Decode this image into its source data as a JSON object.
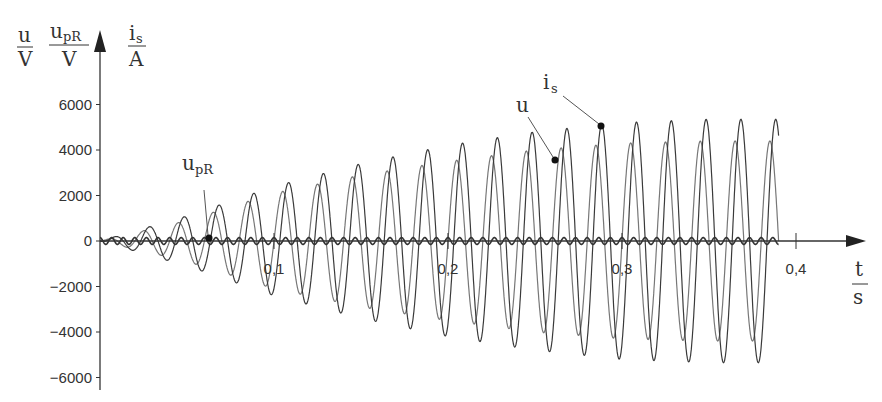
{
  "chart_data": {
    "type": "line",
    "title": "",
    "xlabel": "t / s",
    "ylabel": "u / V, u_pR / V, i_s / A",
    "xlim": [
      0,
      0.44
    ],
    "ylim": [
      -6500,
      7500
    ],
    "x_ticks": [
      0.1,
      0.2,
      0.3,
      0.4
    ],
    "x_tick_labels": [
      "0,1",
      "0,2",
      "0,3",
      "0,4"
    ],
    "y_ticks": [
      6000,
      4000,
      2000,
      0,
      -2000,
      -4000,
      -6000
    ],
    "y_tick_labels": [
      "6000",
      "4000",
      "2000",
      "0",
      "−2000",
      "−4000",
      "−6000"
    ],
    "grid": false,
    "legend": "inline annotations with leader lines",
    "frequency_hz": 50,
    "t_end": 0.39,
    "series": [
      {
        "name": "u",
        "label": "u",
        "description": "voltage, sinusoid with growing amplitude",
        "envelope": [
          {
            "t": 0.0,
            "amp": 0
          },
          {
            "t": 0.05,
            "amp": 900
          },
          {
            "t": 0.1,
            "amp": 2100
          },
          {
            "t": 0.15,
            "amp": 2900
          },
          {
            "t": 0.2,
            "amp": 3500
          },
          {
            "t": 0.25,
            "amp": 4000
          },
          {
            "t": 0.3,
            "amp": 4300
          },
          {
            "t": 0.35,
            "amp": 4400
          },
          {
            "t": 0.39,
            "amp": 4400
          }
        ],
        "phase_deg": 0,
        "color": "#777777"
      },
      {
        "name": "i_s",
        "label": "i_s",
        "description": "current, sinusoid with growing amplitude",
        "envelope": [
          {
            "t": 0.0,
            "amp": 0
          },
          {
            "t": 0.05,
            "amp": 1100
          },
          {
            "t": 0.1,
            "amp": 2400
          },
          {
            "t": 0.15,
            "amp": 3400
          },
          {
            "t": 0.2,
            "amp": 4200
          },
          {
            "t": 0.25,
            "amp": 4800
          },
          {
            "t": 0.3,
            "amp": 5200
          },
          {
            "t": 0.35,
            "amp": 5350
          },
          {
            "t": 0.39,
            "amp": 5350
          }
        ],
        "phase_deg": -60,
        "color": "#3a3a3a"
      },
      {
        "name": "u_pR",
        "label": "u_pR",
        "description": "small ripple around zero",
        "envelope": [
          {
            "t": 0.0,
            "amp": 150
          },
          {
            "t": 0.39,
            "amp": 150
          }
        ],
        "phase_deg": 90,
        "color": "#333333"
      }
    ],
    "annotations": [
      {
        "text": "u",
        "marker_t": 0.267,
        "marker_y": 3600
      },
      {
        "text": "i_s",
        "marker_t": 0.293,
        "marker_y": 5100
      },
      {
        "text": "u_pR",
        "marker_t": 0.063,
        "marker_y": 100
      }
    ]
  },
  "axis": {
    "y_units": [
      {
        "num": "u",
        "den": "V"
      },
      {
        "num": "u",
        "num_sub": "pR",
        "den": "V"
      },
      {
        "num": "i",
        "num_sub": "s",
        "den": "A"
      }
    ],
    "x_unit": {
      "num": "t",
      "den": "s"
    }
  }
}
